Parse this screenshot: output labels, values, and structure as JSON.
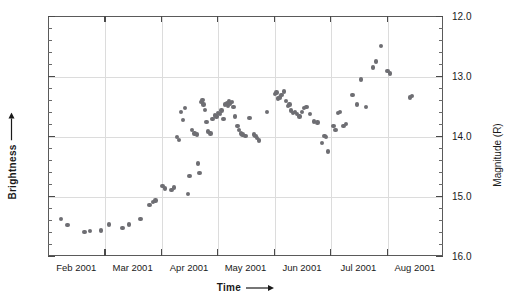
{
  "chart_data": {
    "type": "scatter",
    "title": "3C 279",
    "xlabel": "Time",
    "ylabel_left": "Brightness",
    "ylabel_right": "Magnitude (R)",
    "x_tick_labels": [
      "Feb 2001",
      "Mar 2001",
      "Apr 2001",
      "May 2001",
      "Jun 2001",
      "Jul 2001",
      "Aug 2001"
    ],
    "y_tick_labels": [
      "12.0",
      "13.0",
      "14.0",
      "15.0",
      "16.0"
    ],
    "y_tick_values": [
      12.0,
      13.0,
      14.0,
      15.0,
      16.0
    ],
    "ylim": [
      16.0,
      12.0
    ],
    "y_axis_inverted": true,
    "y_minor_tick_step": 0.2,
    "xlim_months": [
      1.0,
      8.0
    ],
    "grid": true,
    "grid_horizontal_at": [
      13.0,
      14.0,
      15.0
    ],
    "grid_vertical_at_month_boundaries": true,
    "legend": null,
    "marker_color": "#6e6e73",
    "series": [
      {
        "name": "3C 279 R-band magnitude",
        "points": [
          {
            "x": 1.21,
            "y": 15.37
          },
          {
            "x": 1.33,
            "y": 15.47
          },
          {
            "x": 1.63,
            "y": 15.58
          },
          {
            "x": 1.73,
            "y": 15.57
          },
          {
            "x": 1.92,
            "y": 15.56
          },
          {
            "x": 2.06,
            "y": 15.46
          },
          {
            "x": 2.3,
            "y": 15.52
          },
          {
            "x": 2.42,
            "y": 15.46
          },
          {
            "x": 2.62,
            "y": 15.37
          },
          {
            "x": 2.78,
            "y": 15.13
          },
          {
            "x": 2.84,
            "y": 15.08
          },
          {
            "x": 2.89,
            "y": 15.06
          },
          {
            "x": 3.01,
            "y": 14.82
          },
          {
            "x": 3.06,
            "y": 14.86
          },
          {
            "x": 3.17,
            "y": 14.88
          },
          {
            "x": 3.22,
            "y": 14.84
          },
          {
            "x": 3.27,
            "y": 14.0
          },
          {
            "x": 3.3,
            "y": 14.05
          },
          {
            "x": 3.34,
            "y": 13.58
          },
          {
            "x": 3.37,
            "y": 13.72
          },
          {
            "x": 3.41,
            "y": 13.52
          },
          {
            "x": 3.46,
            "y": 14.95
          },
          {
            "x": 3.49,
            "y": 14.65
          },
          {
            "x": 3.53,
            "y": 13.88
          },
          {
            "x": 3.58,
            "y": 13.94
          },
          {
            "x": 3.62,
            "y": 13.96
          },
          {
            "x": 3.64,
            "y": 14.44
          },
          {
            "x": 3.67,
            "y": 14.6
          },
          {
            "x": 3.7,
            "y": 13.42
          },
          {
            "x": 3.72,
            "y": 13.38
          },
          {
            "x": 3.74,
            "y": 13.46
          },
          {
            "x": 3.76,
            "y": 13.55
          },
          {
            "x": 3.79,
            "y": 13.75
          },
          {
            "x": 3.82,
            "y": 13.91
          },
          {
            "x": 3.86,
            "y": 13.94
          },
          {
            "x": 3.9,
            "y": 13.7
          },
          {
            "x": 3.94,
            "y": 13.64
          },
          {
            "x": 3.97,
            "y": 13.66
          },
          {
            "x": 4.0,
            "y": 13.6
          },
          {
            "x": 4.03,
            "y": 13.62
          },
          {
            "x": 4.06,
            "y": 13.56
          },
          {
            "x": 4.09,
            "y": 13.7
          },
          {
            "x": 4.12,
            "y": 13.46
          },
          {
            "x": 4.15,
            "y": 13.44
          },
          {
            "x": 4.17,
            "y": 13.48
          },
          {
            "x": 4.19,
            "y": 13.4
          },
          {
            "x": 4.21,
            "y": 13.44
          },
          {
            "x": 4.24,
            "y": 13.42
          },
          {
            "x": 4.27,
            "y": 13.5
          },
          {
            "x": 4.3,
            "y": 13.66
          },
          {
            "x": 4.34,
            "y": 13.82
          },
          {
            "x": 4.37,
            "y": 13.88
          },
          {
            "x": 4.4,
            "y": 13.94
          },
          {
            "x": 4.43,
            "y": 13.96
          },
          {
            "x": 4.48,
            "y": 13.98
          },
          {
            "x": 4.55,
            "y": 13.68
          },
          {
            "x": 4.63,
            "y": 13.96
          },
          {
            "x": 4.66,
            "y": 13.98
          },
          {
            "x": 4.69,
            "y": 14.02
          },
          {
            "x": 4.72,
            "y": 14.06
          },
          {
            "x": 4.86,
            "y": 13.58
          },
          {
            "x": 5.0,
            "y": 13.28
          },
          {
            "x": 5.03,
            "y": 13.26
          },
          {
            "x": 5.06,
            "y": 13.36
          },
          {
            "x": 5.09,
            "y": 13.34
          },
          {
            "x": 5.12,
            "y": 13.3
          },
          {
            "x": 5.16,
            "y": 13.24
          },
          {
            "x": 5.2,
            "y": 13.4
          },
          {
            "x": 5.23,
            "y": 13.48
          },
          {
            "x": 5.26,
            "y": 13.46
          },
          {
            "x": 5.29,
            "y": 13.56
          },
          {
            "x": 5.32,
            "y": 13.6
          },
          {
            "x": 5.36,
            "y": 13.58
          },
          {
            "x": 5.4,
            "y": 13.62
          },
          {
            "x": 5.44,
            "y": 13.66
          },
          {
            "x": 5.48,
            "y": 13.58
          },
          {
            "x": 5.52,
            "y": 13.52
          },
          {
            "x": 5.56,
            "y": 13.5
          },
          {
            "x": 5.62,
            "y": 13.62
          },
          {
            "x": 5.7,
            "y": 13.74
          },
          {
            "x": 5.76,
            "y": 13.76
          },
          {
            "x": 5.84,
            "y": 14.1
          },
          {
            "x": 5.88,
            "y": 13.98
          },
          {
            "x": 5.91,
            "y": 14.0
          },
          {
            "x": 5.94,
            "y": 14.24
          },
          {
            "x": 6.04,
            "y": 13.82
          },
          {
            "x": 6.08,
            "y": 13.88
          },
          {
            "x": 6.12,
            "y": 13.6
          },
          {
            "x": 6.16,
            "y": 13.58
          },
          {
            "x": 6.22,
            "y": 13.82
          },
          {
            "x": 6.26,
            "y": 13.78
          },
          {
            "x": 6.38,
            "y": 13.3
          },
          {
            "x": 6.46,
            "y": 13.46
          },
          {
            "x": 6.53,
            "y": 13.04
          },
          {
            "x": 6.62,
            "y": 13.5
          },
          {
            "x": 6.74,
            "y": 12.84
          },
          {
            "x": 6.8,
            "y": 12.74
          },
          {
            "x": 6.88,
            "y": 12.48
          },
          {
            "x": 7.0,
            "y": 12.9
          },
          {
            "x": 7.04,
            "y": 12.94
          },
          {
            "x": 7.4,
            "y": 13.34
          },
          {
            "x": 7.43,
            "y": 13.32
          }
        ]
      }
    ]
  },
  "axis_labels": {
    "left_title": "Brightness",
    "right_title": "Magnitude (R)",
    "bottom_title": "Time"
  }
}
